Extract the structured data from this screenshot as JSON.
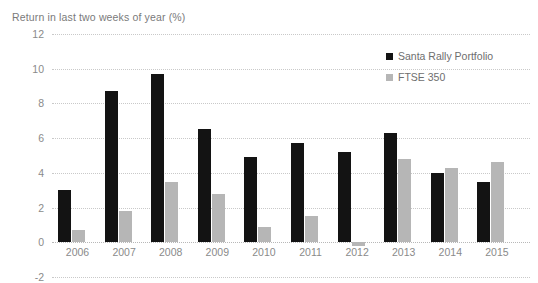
{
  "chart_data": {
    "type": "bar",
    "title": "Return in last two weeks of year (%)",
    "xlabel": "",
    "ylabel": "",
    "ylim": [
      -2,
      12
    ],
    "ytick_step": 2,
    "yticks": [
      12,
      10,
      8,
      6,
      4,
      2,
      0,
      -2
    ],
    "grid": true,
    "legend_position": "top-right",
    "categories": [
      "2006",
      "2007",
      "2008",
      "2009",
      "2010",
      "2011",
      "2012",
      "2013",
      "2014",
      "2015"
    ],
    "series": [
      {
        "name": "Santa Rally Portfolio",
        "color": "#131313",
        "values": [
          3.0,
          8.7,
          9.7,
          6.5,
          4.9,
          5.7,
          5.2,
          6.3,
          4.0,
          3.5
        ]
      },
      {
        "name": "FTSE 350",
        "color": "#b6b6b6",
        "values": [
          0.7,
          1.8,
          3.5,
          2.8,
          0.9,
          1.5,
          -0.2,
          4.8,
          4.3,
          4.6
        ]
      }
    ]
  }
}
